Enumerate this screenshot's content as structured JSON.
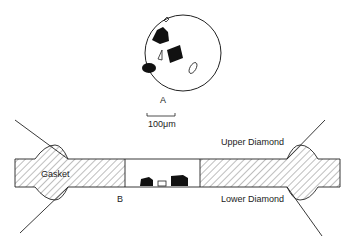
{
  "figure": {
    "panel_a": {
      "label": "A",
      "inner_mark": "A",
      "description": "View through diamond anvil: sample chamber with sample fragments and ruby chips"
    },
    "scale_bar": {
      "label": "100μm"
    },
    "panel_b": {
      "label": "B",
      "labels": {
        "gasket": "Gasket",
        "upper_diamond": "Upper Diamond",
        "lower_diamond": "Lower Diamond"
      }
    },
    "colors": {
      "ink": "#1a1a1a",
      "background": "#ffffff"
    }
  }
}
